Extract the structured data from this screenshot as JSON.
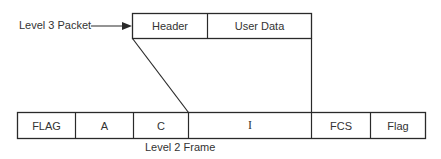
{
  "diagram": {
    "packet": {
      "label": "Level 3 Packet",
      "fields": [
        {
          "name": "header",
          "label": "Header"
        },
        {
          "name": "user-data",
          "label": "User Data"
        }
      ]
    },
    "frame": {
      "label": "Level 2 Frame",
      "fields": [
        {
          "name": "flag-start",
          "label": "FLAG"
        },
        {
          "name": "address",
          "label": "A"
        },
        {
          "name": "control",
          "label": "C"
        },
        {
          "name": "information",
          "label": "I"
        },
        {
          "name": "fcs",
          "label": "FCS"
        },
        {
          "name": "flag-end",
          "label": "Flag"
        }
      ]
    },
    "colors": {
      "line": "#2a2a2a",
      "background": "#ffffff",
      "text": "#333333"
    }
  }
}
